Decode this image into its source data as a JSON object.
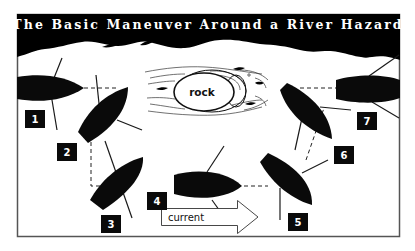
{
  "diagram": {
    "title": "The Basic Maneuver Around a River Hazard",
    "obstacle": {
      "label": "rock"
    },
    "current": {
      "label": "current",
      "direction": "right"
    },
    "positions": [
      {
        "number": "1"
      },
      {
        "number": "2"
      },
      {
        "number": "3"
      },
      {
        "number": "4"
      },
      {
        "number": "5"
      },
      {
        "number": "6"
      },
      {
        "number": "7"
      }
    ],
    "colors": {
      "ink": "#0a0a0a",
      "background": "#ffffff",
      "frame": "#555555"
    }
  }
}
